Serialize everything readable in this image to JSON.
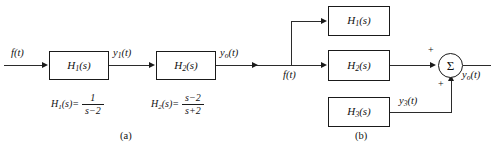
{
  "figure": {
    "panels": [
      {
        "caption": "(a)",
        "type": "cascade-block-diagram",
        "input_label": "f(t)",
        "blocks": [
          {
            "label_base": "H",
            "label_sub": "1",
            "label_tail": "(s)"
          },
          {
            "label_base": "H",
            "label_sub": "2",
            "label_tail": "(s)"
          }
        ],
        "intermediate_label_base": "y",
        "intermediate_label_sub": "1",
        "intermediate_label_tail": "(t)",
        "output_label_base": "y",
        "output_label_sub": "o",
        "output_label_tail": "(t)",
        "transfer_functions": [
          {
            "lhs_base": "H",
            "lhs_sub": "1",
            "lhs_tail": "(s)=",
            "numerator": "1",
            "denominator": "s−2"
          },
          {
            "lhs_base": "H",
            "lhs_sub": "2",
            "lhs_tail": "(s)=",
            "numerator": "s−2",
            "denominator": "s+2"
          }
        ]
      },
      {
        "caption": "(b)",
        "type": "parallel-block-diagram",
        "input_label": "f(t)",
        "blocks": [
          {
            "label_base": "H",
            "label_sub": "1",
            "label_tail": "(s)"
          },
          {
            "label_base": "H",
            "label_sub": "2",
            "label_tail": "(s)"
          },
          {
            "label_base": "H",
            "label_sub": "3",
            "label_tail": "(s)"
          }
        ],
        "branch_label_base": "y",
        "branch_label_sub": "3",
        "branch_label_tail": "(t)",
        "summer_symbol": "Σ",
        "summer_sign_top": "+",
        "summer_sign_bottom": "+",
        "output_label_base": "y",
        "output_label_sub": "o",
        "output_label_tail": "(t)"
      }
    ]
  },
  "colors": {
    "line": "#2b2b2b",
    "text": "#111111",
    "background": "#ffffff"
  }
}
